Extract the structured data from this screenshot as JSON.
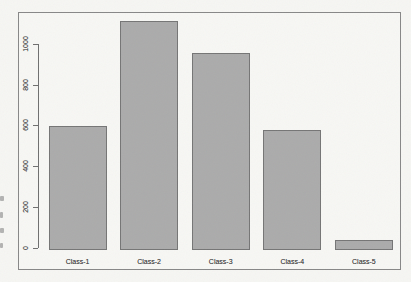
{
  "figure": {
    "background": "#f7f7f4",
    "border_color": "#878787"
  },
  "chart_data": {
    "type": "bar",
    "title": "",
    "xlabel": "",
    "ylabel": "",
    "categories": [
      "Class-1",
      "Class-2",
      "Class-3",
      "Class-4",
      "Class-5"
    ],
    "values": [
      610,
      1130,
      970,
      590,
      50
    ],
    "yticks": [
      0,
      200,
      400,
      600,
      800,
      1000
    ],
    "ylim": [
      0,
      1160
    ],
    "grid": false,
    "legend": "none",
    "bar_fill": "#ababab",
    "bar_border": "#757575",
    "axis_color": "#6f6f6f",
    "tick_label_color": "#4d4d4d"
  }
}
